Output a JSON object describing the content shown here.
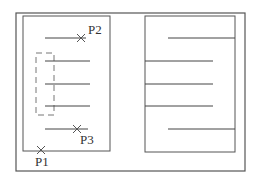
{
  "diagram": {
    "colors": {
      "frame": "#555555",
      "line": "#444444",
      "dashed": "#777777",
      "marker": "#555555",
      "text": "#333333"
    },
    "outer_frame": {
      "x": 16,
      "y": 13,
      "w": 229,
      "h": 158
    },
    "left_box": {
      "x": 23,
      "y": 16,
      "w": 87,
      "h": 135
    },
    "right_box": {
      "x": 145,
      "y": 16,
      "w": 90,
      "h": 136
    },
    "dashed_rect": {
      "x": 36,
      "y": 53,
      "w": 18,
      "h": 62
    },
    "left_lines": [
      {
        "x1": 45,
        "x2": 86,
        "y": 38
      },
      {
        "x1": 45,
        "x2": 90,
        "y": 61
      },
      {
        "x1": 45,
        "x2": 90,
        "y": 84
      },
      {
        "x1": 45,
        "x2": 90,
        "y": 106
      },
      {
        "x1": 45,
        "x2": 88,
        "y": 129
      }
    ],
    "right_lines": [
      {
        "x1": 168,
        "x2": 235,
        "y": 38
      },
      {
        "x1": 145,
        "x2": 213,
        "y": 61
      },
      {
        "x1": 145,
        "x2": 213,
        "y": 84
      },
      {
        "x1": 145,
        "x2": 213,
        "y": 106
      },
      {
        "x1": 168,
        "x2": 235,
        "y": 129
      }
    ],
    "points": [
      {
        "label": "P2",
        "x": 81,
        "y": 38,
        "lx": 88,
        "ly": 34
      },
      {
        "label": "P3",
        "x": 77,
        "y": 129,
        "lx": 80,
        "ly": 144
      },
      {
        "label": "P1",
        "x": 41,
        "y": 150,
        "lx": 35,
        "ly": 166
      }
    ]
  }
}
